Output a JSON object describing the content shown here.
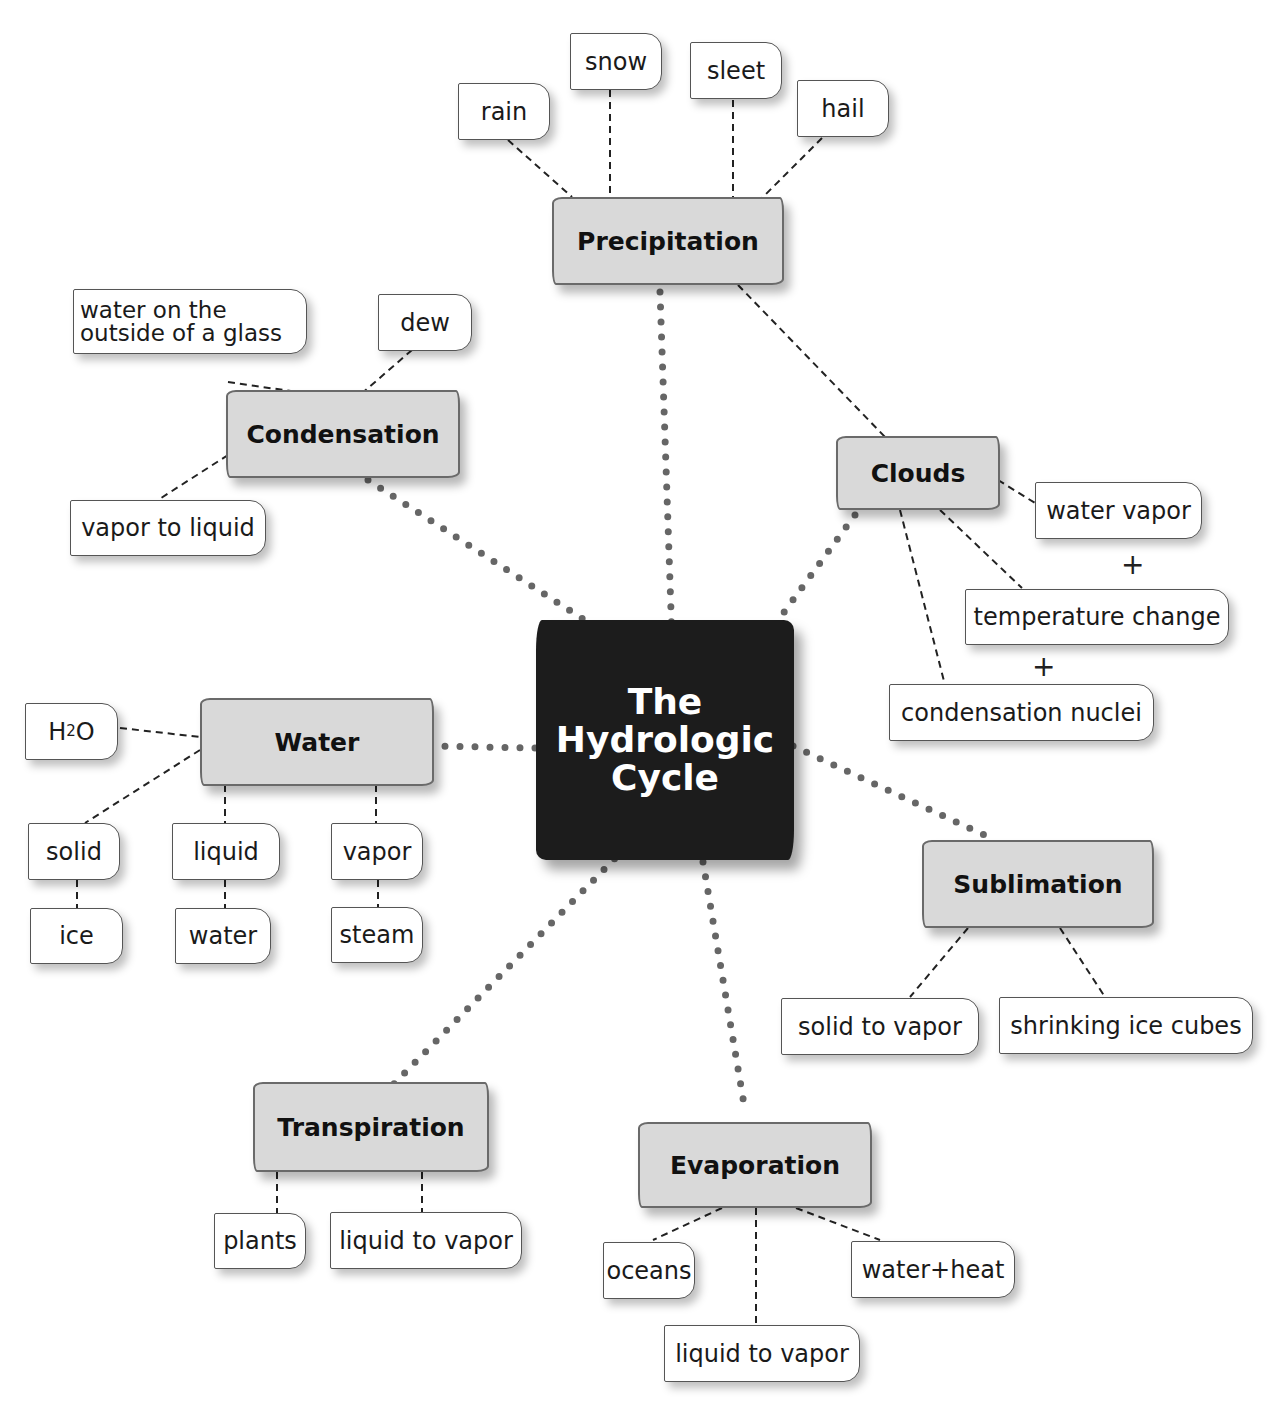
{
  "title": "The Hydrologic Cycle",
  "center": {
    "lines": [
      "The",
      "Hydrologic",
      "Cycle"
    ]
  },
  "nodes": {
    "precipitation": {
      "label": "Precipitation",
      "leaves": [
        "rain",
        "snow",
        "sleet",
        "hail"
      ]
    },
    "condensation": {
      "label": "Condensation",
      "leaves": [
        "water on the outside of a glass",
        "dew",
        "vapor to liquid"
      ],
      "leaf_lines": [
        "water on the",
        "outside of a glass"
      ]
    },
    "clouds": {
      "label": "Clouds",
      "leaves": [
        "water vapor",
        "temperature change",
        "condensation nuclei"
      ],
      "operators": [
        "+",
        "+"
      ]
    },
    "water": {
      "label": "Water",
      "leaves": [
        "H2O",
        "solid",
        "liquid",
        "vapor",
        "ice",
        "water",
        "steam"
      ],
      "h2o": {
        "h": "H",
        "sub": "2",
        "o": "O"
      }
    },
    "sublimation": {
      "label": "Sublimation",
      "leaves": [
        "solid to vapor",
        "shrinking ice cubes"
      ]
    },
    "transpiration": {
      "label": "Transpiration",
      "leaves": [
        "plants",
        "liquid to vapor"
      ]
    },
    "evaporation": {
      "label": "Evaporation",
      "leaves": [
        "oceans",
        "liquid to vapor",
        "water+heat"
      ]
    }
  },
  "colors": {
    "center_bg": "#1c1c1c",
    "node_bg": "#d9d9d9",
    "leaf_bg": "#ffffff",
    "dot_link": "#666666",
    "dash_link": "#222222"
  }
}
